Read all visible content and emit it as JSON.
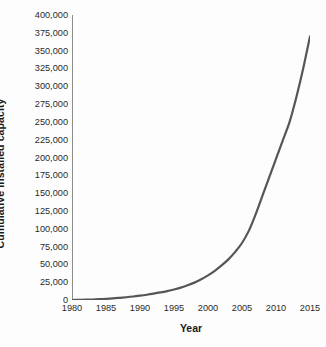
{
  "chart_data": {
    "type": "line",
    "title": "",
    "xlabel": "Year",
    "ylabel": "Cumulative installed capacity",
    "xlim": [
      1980,
      2015
    ],
    "ylim": [
      0,
      400000
    ],
    "grid": false,
    "legend": "none",
    "line_color": "#565656",
    "axis_color": "#8c8c8c",
    "text_color": "#2a2a2a",
    "background": "#fdfdfd",
    "y_ticks": [
      0,
      25000,
      50000,
      75000,
      100000,
      125000,
      150000,
      175000,
      200000,
      225000,
      250000,
      275000,
      300000,
      325000,
      350000,
      375000,
      400000
    ],
    "y_tick_labels": [
      "0",
      "25,000",
      "50,000",
      "75,000",
      "100,000",
      "125,000",
      "150,000",
      "175,000",
      "200,000",
      "225,000",
      "250,000",
      "275,000",
      "300,000",
      "325,000",
      "350,000",
      "375,000",
      "400,000"
    ],
    "x_ticks": [
      1980,
      1985,
      1990,
      1995,
      2000,
      2005,
      2010,
      2015
    ],
    "x_tick_labels": [
      "1980",
      "1985",
      "1990",
      "1995",
      "2000",
      "2005",
      "2010",
      "2015"
    ],
    "x_minor_tick_step": 1,
    "x": [
      1980,
      1981,
      1982,
      1983,
      1984,
      1985,
      1986,
      1987,
      1988,
      1989,
      1990,
      1991,
      1992,
      1993,
      1994,
      1995,
      1996,
      1997,
      1998,
      1999,
      2000,
      2001,
      2002,
      2003,
      2004,
      2005,
      2006,
      2007,
      2008,
      2009,
      2010,
      2011,
      2012,
      2013,
      2014,
      2015
    ],
    "y": [
      0,
      200,
      400,
      700,
      1100,
      1600,
      2200,
      3000,
      3900,
      4900,
      6100,
      7400,
      8900,
      10600,
      12500,
      14700,
      17400,
      20600,
      24400,
      29000,
      34500,
      41000,
      48500,
      57000,
      67500,
      80000,
      97000,
      120000,
      146000,
      172000,
      198000,
      224000,
      250000,
      285000,
      325000,
      370000
    ],
    "annotations": []
  },
  "axes": {
    "y_title": "Cumulative installed capacity",
    "x_title": "Year"
  }
}
